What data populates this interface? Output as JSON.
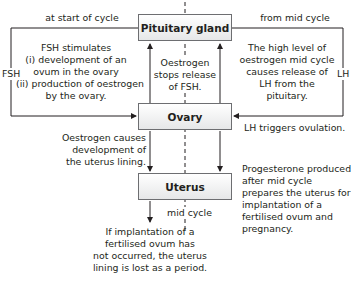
{
  "colors": {
    "line": "#231f20",
    "box_border": "#6d6e71",
    "box_fill_top": "#ffffff",
    "box_fill_bottom": "#e6e7e8",
    "text": "#231f20"
  },
  "boxes": {
    "pituitary": "Pituitary gland",
    "ovary": "Ovary",
    "uterus": "Uterus"
  },
  "labels": {
    "at_start_of_cycle": "at start of cycle",
    "from_mid_cycle": "from mid cycle",
    "fsh_side": "FSH",
    "lh_side": "LH",
    "fsh_stimulates": [
      "FSH stimulates",
      "(i) development of an",
      "ovum in the ovary",
      "(ii) production of oestrogen",
      "by the ovary."
    ],
    "oestrogen_stops": [
      "Oestrogen",
      "stops release",
      "of FSH."
    ],
    "high_level": [
      "The high level of",
      "oestrogen mid cycle",
      "causes release of",
      "LH from the",
      "pituitary."
    ],
    "lh_triggers": "LH triggers ovulation.",
    "oestrogen_causes": [
      "Oestrogen causes",
      "development of",
      "the uterus lining."
    ],
    "progesterone": [
      "Progesterone produced",
      "after mid cycle",
      "prepares the uterus for",
      "implantation of a",
      "fertilised ovum and",
      "pregnancy."
    ],
    "mid_cycle": "mid cycle",
    "if_implantation": [
      "If implantation of a",
      "fertilised ovum has",
      "not occurred, the uterus",
      "lining is lost as a period."
    ]
  }
}
